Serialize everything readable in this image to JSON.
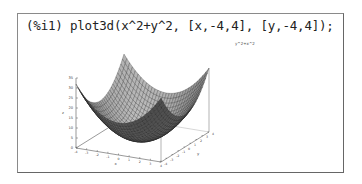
{
  "cell": {
    "prompt": "(%i1)",
    "command": "plot3d(x^2+y^2, [x,-4,4], [y,-4,4]);"
  },
  "chart_data": {
    "type": "surface",
    "title": "y^2+x^2",
    "function": "x^2+y^2",
    "x_range": [
      -4,
      4
    ],
    "y_range": [
      -4,
      4
    ],
    "zlim": [
      0,
      35
    ],
    "z_ticks": [
      0,
      5,
      10,
      15,
      20,
      25,
      30,
      35
    ],
    "x_ticks": [
      -4,
      -3,
      -2,
      -1,
      0,
      1,
      2,
      3,
      4
    ],
    "y_ticks": [
      -4,
      -3,
      -2,
      -1,
      0,
      1,
      2,
      3,
      4
    ],
    "xlabel": "x",
    "ylabel": "y",
    "zlabel": "z"
  }
}
